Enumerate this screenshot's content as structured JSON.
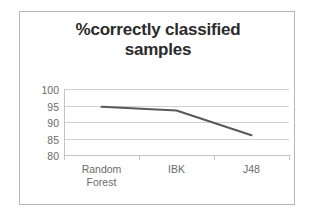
{
  "chart_data": {
    "type": "line",
    "title": "%correctly classified samples",
    "title_lines": [
      "%correctly classified",
      "samples"
    ],
    "categories": [
      "Random Forest",
      "IBK",
      "J48"
    ],
    "category_lines": [
      [
        "Random",
        "Forest"
      ],
      [
        "IBK",
        ""
      ],
      [
        "J48",
        ""
      ]
    ],
    "values": [
      94.6,
      93.5,
      86.0
    ],
    "series": [
      {
        "name": "%correctly classified samples",
        "values": [
          94.6,
          93.5,
          86.0
        ],
        "color": "#595959"
      }
    ],
    "xlabel": "",
    "ylabel": "",
    "ylim": [
      80,
      100
    ],
    "ytick_labels": [
      "100",
      "95",
      "90",
      "85",
      "80"
    ],
    "ytick_values": [
      100,
      95,
      90,
      85,
      80
    ],
    "ystep": 5,
    "grid": true,
    "grid_axis": "y",
    "legend": false,
    "markers": false,
    "colors": {
      "series_line": "#595959",
      "gridline": "#d2d2d2",
      "axis": "#c4c4c4",
      "tick_label": "#6b6b6b",
      "title": "#2b2b2b",
      "border": "#b7b7b7",
      "background": "#ffffff"
    }
  }
}
